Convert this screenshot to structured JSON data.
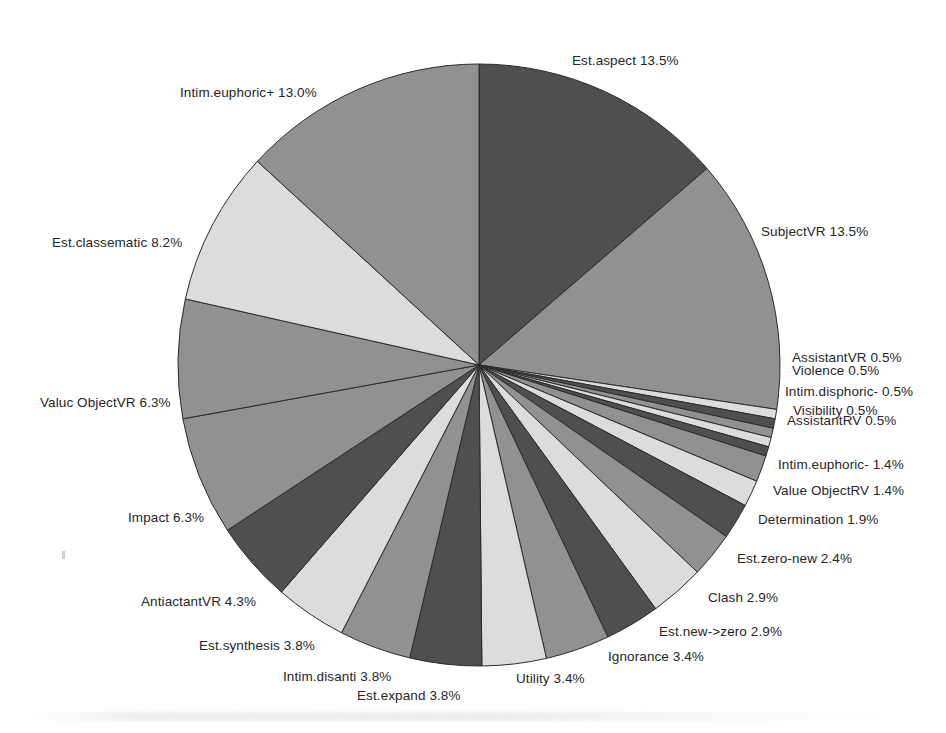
{
  "chart_data": {
    "type": "pie",
    "title": "",
    "legend_position": "outside-labels",
    "label_format": "{name} {percent}%",
    "center": {
      "x": 479,
      "y": 365
    },
    "radius": 301,
    "start_angle_deg": -90,
    "direction": "clockwise",
    "categories": [
      "Est.aspect",
      "SubjectVR",
      "AssistantVR",
      "Violence",
      "Intim.disphoric-",
      "Visibility",
      "AssistantRV",
      "Intim.euphoric-",
      "Value ObjectRV",
      "Determination",
      "Est.zero-new",
      "Clash",
      "Est.new->zero",
      "Ignorance",
      "Utility",
      "Est.expand",
      "Intim.disanti",
      "Est.synthesis",
      "AntiactantVR",
      "Impact",
      "Valuc ObjectVR",
      "Est.classematic",
      "Intim.euphoric+"
    ],
    "values": [
      13.5,
      13.5,
      0.5,
      0.5,
      0.5,
      0.5,
      0.5,
      1.4,
      1.4,
      1.9,
      2.4,
      2.9,
      2.9,
      3.4,
      3.4,
      3.8,
      3.8,
      3.8,
      4.3,
      6.3,
      6.3,
      8.2,
      13.0
    ],
    "unit": "%",
    "colors": [
      "#4f4f4f",
      "#919191",
      "#dcdcdc",
      "#4f4f4f",
      "#919191",
      "#dcdcdc",
      "#4f4f4f",
      "#919191",
      "#dcdcdc",
      "#4f4f4f",
      "#919191",
      "#dcdcdc",
      "#4f4f4f",
      "#919191",
      "#dcdcdc",
      "#4f4f4f",
      "#919191",
      "#dcdcdc",
      "#4f4f4f",
      "#919191",
      "#919191",
      "#dcdcdc",
      "#919191"
    ],
    "slice_border_color": "#2b2b2b",
    "slices": [
      {
        "name": "Est.aspect",
        "percent": 13.5,
        "label": "Est.aspect  13.5%",
        "color": "#4f4f4f",
        "label_x": 572,
        "label_y": 60,
        "align": "right"
      },
      {
        "name": "SubjectVR",
        "percent": 13.5,
        "label": "SubjectVR  13.5%",
        "color": "#919191",
        "label_x": 761,
        "label_y": 231,
        "align": "right"
      },
      {
        "name": "AssistantVR",
        "percent": 0.5,
        "label": "AssistantVR  0.5%",
        "color": "#dcdcdc",
        "label_x": 792,
        "label_y": 357,
        "align": "right"
      },
      {
        "name": "Violence",
        "percent": 0.5,
        "label": "Violence  0.5%",
        "color": "#4f4f4f",
        "label_x": 792,
        "label_y": 370,
        "align": "right"
      },
      {
        "name": "Intim.disphoric-",
        "percent": 0.5,
        "label": "Intim.disphoric-  0.5%",
        "color": "#919191",
        "label_x": 785,
        "label_y": 391,
        "align": "right"
      },
      {
        "name": "Visibility",
        "percent": 0.5,
        "label": "Visibility  0.5%",
        "color": "#dcdcdc",
        "label_x": 793,
        "label_y": 410,
        "align": "right"
      },
      {
        "name": "AssistantRV",
        "percent": 0.5,
        "label": "AssistantRV  0.5%",
        "color": "#4f4f4f",
        "label_x": 787,
        "label_y": 420,
        "align": "right"
      },
      {
        "name": "Intim.euphoric-",
        "percent": 1.4,
        "label": "Intim.euphoric-  1.4%",
        "color": "#919191",
        "label_x": 778,
        "label_y": 464,
        "align": "right"
      },
      {
        "name": "Value ObjectRV",
        "percent": 1.4,
        "label": "Value ObjectRV  1.4%",
        "color": "#dcdcdc",
        "label_x": 773,
        "label_y": 490,
        "align": "right"
      },
      {
        "name": "Determination",
        "percent": 1.9,
        "label": "Determination  1.9%",
        "color": "#4f4f4f",
        "label_x": 758,
        "label_y": 519,
        "align": "right"
      },
      {
        "name": "Est.zero-new",
        "percent": 2.4,
        "label": "Est.zero-new  2.4%",
        "color": "#919191",
        "label_x": 737,
        "label_y": 558,
        "align": "right"
      },
      {
        "name": "Clash",
        "percent": 2.9,
        "label": "Clash  2.9%",
        "color": "#dcdcdc",
        "label_x": 708,
        "label_y": 597,
        "align": "right"
      },
      {
        "name": "Est.new->zero",
        "percent": 2.9,
        "label": "Est.new->zero  2.9%",
        "color": "#4f4f4f",
        "label_x": 659,
        "label_y": 631,
        "align": "right"
      },
      {
        "name": "Ignorance",
        "percent": 3.4,
        "label": "Ignorance  3.4%",
        "color": "#919191",
        "label_x": 608,
        "label_y": 656,
        "align": "right"
      },
      {
        "name": "Utility",
        "percent": 3.4,
        "label": "Utility  3.4%",
        "color": "#dcdcdc",
        "label_x": 516,
        "label_y": 678,
        "align": "right"
      },
      {
        "name": "Est.expand",
        "percent": 3.8,
        "label": "Est.expand  3.8%",
        "color": "#4f4f4f",
        "label_x": 357,
        "label_y": 695,
        "align": "right"
      },
      {
        "name": "Intim.disanti",
        "percent": 3.8,
        "label": "Intim.disanti  3.8%",
        "color": "#919191",
        "label_x": 283,
        "label_y": 676,
        "align": "right"
      },
      {
        "name": "Est.synthesis",
        "percent": 3.8,
        "label": "Est.synthesis  3.8%",
        "color": "#dcdcdc",
        "label_x": 199,
        "label_y": 645,
        "align": "right"
      },
      {
        "name": "AntiactantVR",
        "percent": 4.3,
        "label": "AntiactantVR  4.3%",
        "color": "#4f4f4f",
        "label_x": 141,
        "label_y": 601,
        "align": "right"
      },
      {
        "name": "Impact",
        "percent": 6.3,
        "label": "Impact  6.3%",
        "color": "#919191",
        "label_x": 128,
        "label_y": 517,
        "align": "right"
      },
      {
        "name": "Valuc ObjectVR",
        "percent": 6.3,
        "label": "Valuc ObjectVR  6.3%",
        "color": "#919191",
        "label_x": 40,
        "label_y": 402,
        "align": "right"
      },
      {
        "name": "Est.classematic",
        "percent": 8.2,
        "label": "Est.classematic  8.2%",
        "color": "#dcdcdc",
        "label_x": 52,
        "label_y": 242,
        "align": "right"
      },
      {
        "name": "Intim.euphoric+",
        "percent": 13.0,
        "label": "Intim.euphoric+  13.0%",
        "color": "#919191",
        "label_x": 180,
        "label_y": 92,
        "align": "right"
      }
    ]
  }
}
